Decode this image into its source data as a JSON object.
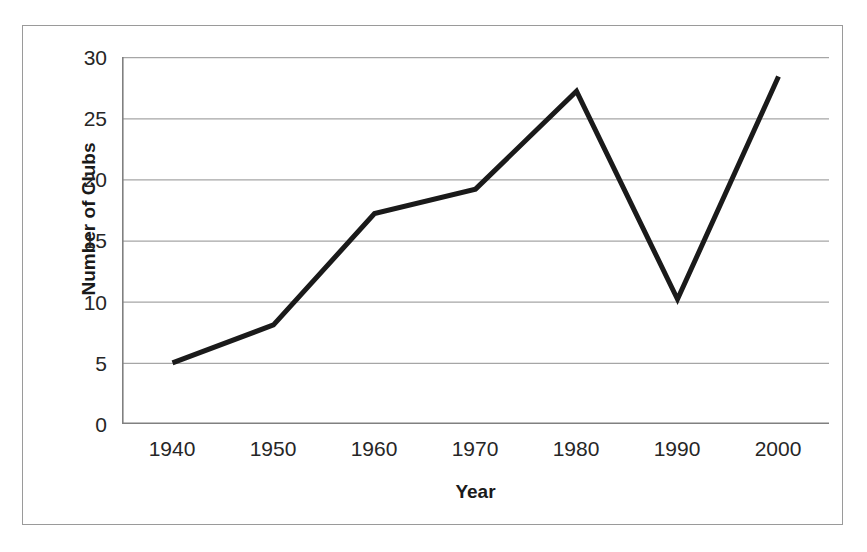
{
  "chart_data": {
    "type": "line",
    "title": "",
    "xlabel": "Year",
    "ylabel": "Number of Clubs",
    "categories": [
      "1940",
      "1950",
      "1960",
      "1970",
      "1980",
      "1990",
      "2000"
    ],
    "x": [
      1940,
      1950,
      1960,
      1970,
      1980,
      1990,
      2000
    ],
    "series": [
      {
        "name": "Number of Clubs",
        "values": [
          5.0,
          8.1,
          17.2,
          19.2,
          27.2,
          10.2,
          28.4
        ],
        "color": "#1a1a1a",
        "line_width": 5,
        "markers": false
      }
    ],
    "ylim": [
      0,
      30
    ],
    "xlim_categories": true,
    "y_ticks": [
      0,
      5,
      10,
      15,
      20,
      25,
      30
    ],
    "y_tick_labels": [
      "0",
      "5",
      "10",
      "15",
      "20",
      "25",
      "30"
    ],
    "grid": {
      "horizontal": true,
      "vertical": false,
      "color": "#a6a6a6"
    },
    "legend": {
      "visible": false,
      "position": "none"
    },
    "axis": {
      "line_color": "#808080",
      "tick_marks": "outside",
      "frame_color": "#9a9a9a"
    },
    "background_color": "#ffffff",
    "annotations": []
  }
}
